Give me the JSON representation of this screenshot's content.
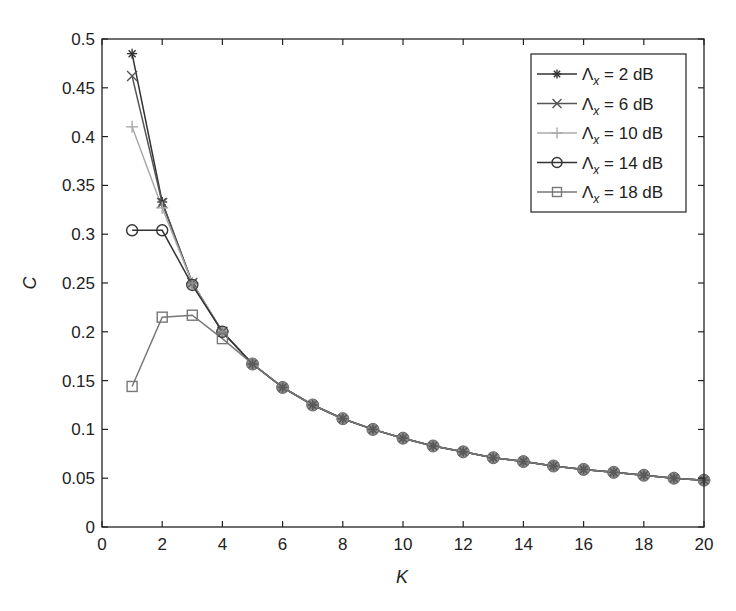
{
  "chart_data": {
    "type": "line",
    "title": "",
    "xlabel": "K",
    "ylabel": "C",
    "xlim": [
      0,
      20
    ],
    "ylim": [
      0,
      0.5
    ],
    "xticks": [
      0,
      2,
      4,
      6,
      8,
      10,
      12,
      14,
      16,
      18,
      20
    ],
    "xtick_labels": [
      "0",
      "2",
      "4",
      "6",
      "8",
      "10",
      "12",
      "14",
      "16",
      "18",
      "20"
    ],
    "yticks": [
      0,
      0.05,
      0.1,
      0.15,
      0.2,
      0.25,
      0.3,
      0.35,
      0.4,
      0.45,
      0.5
    ],
    "ytick_labels": [
      "0",
      "0.05",
      "0.1",
      "0.15",
      "0.2",
      "0.25",
      "0.3",
      "0.35",
      "0.4",
      "0.45",
      "0.5"
    ],
    "grid": false,
    "legend_position": "upper right",
    "x": [
      1,
      2,
      3,
      4,
      5,
      6,
      7,
      8,
      9,
      10,
      11,
      12,
      13,
      14,
      15,
      16,
      17,
      18,
      19,
      20
    ],
    "series": [
      {
        "name": "Λx = 2 dB",
        "legend_main": "Λ",
        "legend_sub": "x",
        "legend_rest": " = 2 dB",
        "marker": "asterisk",
        "color": "#333333",
        "values": [
          0.485,
          0.333,
          0.25,
          0.2,
          0.167,
          0.143,
          0.125,
          0.111,
          0.1,
          0.091,
          0.083,
          0.077,
          0.071,
          0.067,
          0.0625,
          0.059,
          0.056,
          0.053,
          0.05,
          0.048
        ]
      },
      {
        "name": "Λx = 6 dB",
        "legend_main": "Λ",
        "legend_sub": "x",
        "legend_rest": " = 6 dB",
        "marker": "x",
        "color": "#555555",
        "values": [
          0.462,
          0.332,
          0.25,
          0.2,
          0.167,
          0.143,
          0.125,
          0.111,
          0.1,
          0.091,
          0.083,
          0.077,
          0.071,
          0.067,
          0.0625,
          0.059,
          0.056,
          0.053,
          0.05,
          0.048
        ]
      },
      {
        "name": "Λx = 10 dB",
        "legend_main": "Λ",
        "legend_sub": "x",
        "legend_rest": " = 10 dB",
        "marker": "plus",
        "color": "#aaaaaa",
        "values": [
          0.41,
          0.327,
          0.25,
          0.2,
          0.167,
          0.143,
          0.125,
          0.111,
          0.1,
          0.091,
          0.083,
          0.077,
          0.071,
          0.067,
          0.0625,
          0.059,
          0.056,
          0.053,
          0.05,
          0.048
        ]
      },
      {
        "name": "Λx = 14 dB",
        "legend_main": "Λ",
        "legend_sub": "x",
        "legend_rest": " = 14 dB",
        "marker": "circle",
        "color": "#333333",
        "values": [
          0.304,
          0.304,
          0.248,
          0.2,
          0.167,
          0.143,
          0.125,
          0.111,
          0.1,
          0.091,
          0.083,
          0.077,
          0.071,
          0.067,
          0.0625,
          0.059,
          0.056,
          0.053,
          0.05,
          0.048
        ]
      },
      {
        "name": "Λx = 18 dB",
        "legend_main": "Λ",
        "legend_sub": "x",
        "legend_rest": " = 18 dB",
        "marker": "square",
        "color": "#777777",
        "values": [
          0.144,
          0.215,
          0.217,
          0.193,
          0.167,
          0.143,
          0.125,
          0.111,
          0.1,
          0.091,
          0.083,
          0.077,
          0.071,
          0.067,
          0.0625,
          0.059,
          0.056,
          0.053,
          0.05,
          0.048
        ]
      }
    ]
  }
}
